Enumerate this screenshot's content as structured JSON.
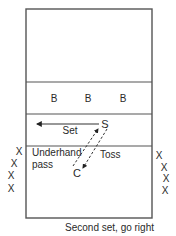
{
  "diagram": {
    "colors": {
      "line": "#555555",
      "text": "#2a2a2a",
      "background": "#ffffff"
    },
    "court": {
      "x": 26,
      "y": 9,
      "width": 126,
      "height": 209,
      "lines_y": [
        82,
        114,
        146
      ]
    },
    "blockers": {
      "label": "B",
      "positions": [
        {
          "x": 54,
          "y": 102
        },
        {
          "x": 88,
          "y": 102
        },
        {
          "x": 123,
          "y": 102
        }
      ]
    },
    "setter": {
      "label": "S",
      "x": 105,
      "y": 128
    },
    "coach": {
      "label": "C",
      "x": 77,
      "y": 177
    },
    "set_arrow": {
      "label": "Set",
      "x1": 99,
      "y1": 124,
      "x2": 37,
      "y2": 124,
      "label_x": 70,
      "label_y": 134
    },
    "pass_arrow": {
      "label_line1": "Underhand",
      "label_line2": "pass",
      "x1": 73,
      "y1": 166,
      "x2": 98,
      "y2": 129,
      "label_x": 32,
      "label_y": 156,
      "label_y2": 168
    },
    "toss_arrow": {
      "label": "Toss",
      "x1": 107,
      "y1": 129,
      "x2": 83,
      "y2": 168,
      "label_x": 100,
      "label_y": 158
    },
    "left_line": {
      "label": "X",
      "positions": [
        {
          "x": 19,
          "y": 155
        },
        {
          "x": 14,
          "y": 167
        },
        {
          "x": 11,
          "y": 179
        },
        {
          "x": 11,
          "y": 192
        }
      ]
    },
    "right_line": {
      "label": "X",
      "positions": [
        {
          "x": 159,
          "y": 159
        },
        {
          "x": 164,
          "y": 171
        },
        {
          "x": 166,
          "y": 182
        },
        {
          "x": 165,
          "y": 194
        }
      ]
    },
    "caption": {
      "text": "Second set, go right",
      "x": 154,
      "y": 231
    }
  }
}
